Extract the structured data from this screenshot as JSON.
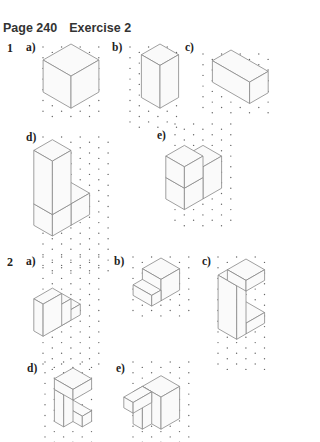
{
  "heading": {
    "page": "Page 240",
    "exercise": "Exercise 2"
  },
  "questions": [
    {
      "number": "1",
      "parts": [
        "a)",
        "b)",
        "c)",
        "d)",
        "e)"
      ]
    },
    {
      "number": "2",
      "parts": [
        "a)",
        "b)",
        "c)",
        "d)",
        "e)"
      ]
    }
  ],
  "figures": [
    {
      "id": "1a",
      "description": "cube 3x3x3 on isometric dot grid"
    },
    {
      "id": "1b",
      "description": "cuboid 2x2x4 on isometric dot grid"
    },
    {
      "id": "1c",
      "description": "cuboid 4x2x2 lying flat on isometric dot grid"
    },
    {
      "id": "1d",
      "description": "L-shaped prism on isometric dot grid"
    },
    {
      "id": "1e",
      "description": "step-shaped solid on isometric dot grid"
    },
    {
      "id": "2a",
      "description": "three-step staircase solid on isometric dot grid"
    },
    {
      "id": "2b",
      "description": "low step block solid on isometric dot grid"
    },
    {
      "id": "2c",
      "description": "C-shaped solid on isometric dot grid"
    },
    {
      "id": "2d",
      "description": "I-beam shaped solid on isometric dot grid"
    },
    {
      "id": "2e",
      "description": "hollow frame solid on isometric dot grid"
    }
  ]
}
